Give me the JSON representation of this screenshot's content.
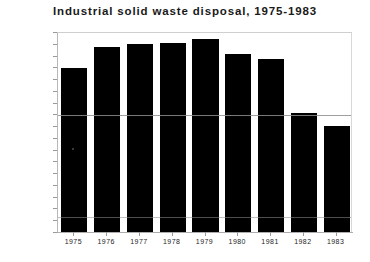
{
  "chart_data": {
    "type": "bar",
    "title": "Industrial solid waste disposal, 1975-1983",
    "xlabel": "",
    "ylabel": "Million short tons",
    "categories": [
      "1975",
      "1976",
      "1977",
      "1978",
      "1979",
      "1980",
      "1981",
      "1982",
      "1983"
    ],
    "values": [
      139,
      157,
      160,
      161,
      164,
      151,
      147,
      101,
      90
    ],
    "ylim": [
      0,
      170
    ],
    "ytick_step": 10,
    "yticks": [
      "0",
      "10",
      "20",
      "30",
      "40",
      "50",
      "60",
      "70",
      "80",
      "90",
      "100",
      "110",
      "120",
      "130",
      "140",
      "150",
      "160",
      "170"
    ],
    "grid": false,
    "legend": null,
    "bar_color": "#000000",
    "axis_color": "#b8b8b8",
    "background": "#ffffff"
  }
}
